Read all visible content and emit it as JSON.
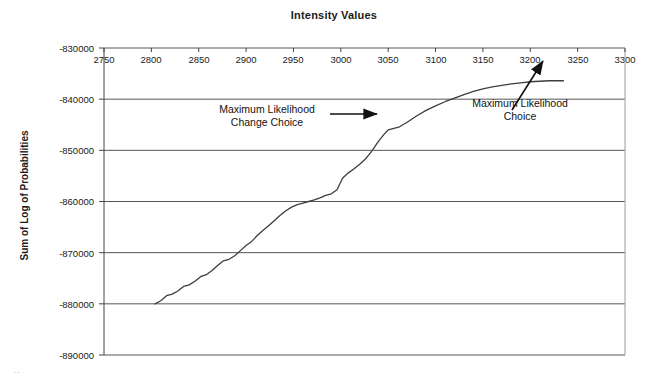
{
  "chart_data": {
    "type": "line",
    "title": "Intensity Values",
    "xlabel": "",
    "ylabel": "Sum of Log of Probabilities",
    "xlim": [
      2750,
      3300
    ],
    "ylim": [
      -890000,
      -830000
    ],
    "grid": "horizontal",
    "legend": "none",
    "x_ticks": [
      2750,
      2800,
      2850,
      2900,
      2950,
      3000,
      3050,
      3100,
      3150,
      3200,
      3250,
      3300
    ],
    "x_tick_labels": [
      "2750",
      "2800",
      "2850",
      "2900",
      "2950",
      "3000",
      "3050",
      "3100",
      "3150",
      "3200",
      "3250",
      "3300"
    ],
    "y_ticks": [
      -830000,
      -840000,
      -850000,
      -860000,
      -870000,
      -880000,
      -890000
    ],
    "y_tick_labels": [
      "-830000",
      "-840000",
      "-850000",
      "-860000",
      "-870000",
      "-880000",
      "-890000"
    ],
    "x_axis_position_value": -830000,
    "series": [
      {
        "name": "Sum of Log of Probabilities",
        "color": "#3d3d3d",
        "x": [
          2804,
          2810,
          2816,
          2822,
          2828,
          2834,
          2840,
          2846,
          2852,
          2858,
          2864,
          2870,
          2876,
          2882,
          2888,
          2894,
          2900,
          2906,
          2912,
          2918,
          2924,
          2930,
          2936,
          2942,
          2948,
          2954,
          2960,
          2966,
          2972,
          2978,
          2984,
          2990,
          2996,
          3002,
          3008,
          3014,
          3020,
          3026,
          3030,
          3034,
          3038,
          3042,
          3046,
          3050,
          3056,
          3062,
          3070,
          3080,
          3090,
          3100,
          3110,
          3120,
          3130,
          3140,
          3150,
          3160,
          3170,
          3180,
          3190,
          3200,
          3210,
          3220,
          3230,
          3235
        ],
        "y": [
          -880000,
          -879400,
          -878400,
          -878100,
          -877500,
          -876600,
          -876300,
          -875600,
          -874700,
          -874300,
          -873500,
          -872500,
          -871600,
          -871300,
          -870600,
          -869600,
          -868600,
          -867800,
          -866600,
          -865600,
          -864700,
          -863700,
          -862700,
          -861800,
          -861100,
          -860600,
          -860300,
          -860000,
          -859700,
          -859300,
          -858800,
          -858500,
          -857700,
          -855400,
          -854400,
          -853600,
          -852700,
          -851700,
          -850800,
          -849800,
          -848700,
          -847700,
          -846800,
          -846000,
          -845700,
          -845400,
          -844500,
          -843300,
          -842200,
          -841300,
          -840500,
          -839800,
          -839100,
          -838500,
          -838000,
          -837600,
          -837300,
          -837000,
          -836800,
          -836600,
          -836500,
          -836400,
          -836400,
          -836400
        ]
      }
    ],
    "annotations": [
      {
        "id": "max-likelihood-change-choice",
        "text": "Maximum Likelihood\nChange Choice",
        "points_to_x": 3030,
        "points_to_y": -850800
      },
      {
        "id": "max-likelihood-choice",
        "text": "Maximum Likelihood\nChoice",
        "points_to_x": 3200,
        "points_to_y": -836600
      }
    ]
  },
  "artifact": {
    "scan_mark": ".."
  }
}
